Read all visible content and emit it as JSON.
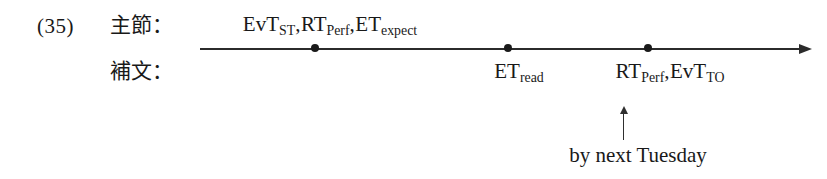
{
  "figure": {
    "example_number": "(35)",
    "background_color": "#ffffff",
    "ink_color": "#191919",
    "axis_color": "#2b2b2b"
  },
  "row_labels": {
    "main_clause": "主節：",
    "complement_clause": "補文："
  },
  "timeline": {
    "axis_start_x": 200,
    "axis_end_x": 812,
    "axis_y": 48,
    "arrowhead": "right-arrowhead",
    "tick_dots": [
      {
        "name": "tick-dot-1",
        "x": 315
      },
      {
        "name": "tick-dot-2",
        "x": 508
      },
      {
        "name": "tick-dot-3",
        "x": 648
      }
    ]
  },
  "event_labels": [
    {
      "id": "main-clause-events",
      "position": "above",
      "center_x": 330,
      "parts": [
        {
          "base": "EvT",
          "sub": "ST"
        },
        {
          "base": "RT",
          "sub": "Perf"
        },
        {
          "base": "ET",
          "sub": "expect"
        }
      ],
      "separator": ","
    },
    {
      "id": "complement-read-event",
      "position": "below",
      "center_x": 519,
      "parts": [
        {
          "base": "ET",
          "sub": "read"
        }
      ],
      "separator": ","
    },
    {
      "id": "complement-perf-to-events",
      "position": "below",
      "center_x": 670,
      "parts": [
        {
          "base": "RT",
          "sub": "Perf"
        },
        {
          "base": "EvT",
          "sub": "TO"
        }
      ],
      "separator": ","
    }
  ],
  "annotation": {
    "pointer_icon": "up-arrow-icon",
    "text": "by next Tuesday",
    "pointer_x": 623,
    "text_center_x": 638
  }
}
